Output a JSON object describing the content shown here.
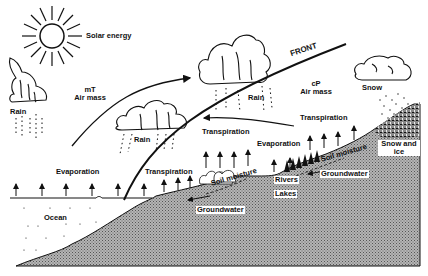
{
  "diagram": {
    "colors": {
      "ink": "#111111",
      "ground": "#9a9a9a",
      "background": "#ffffff"
    },
    "labels": {
      "solar_energy": "Solar energy",
      "front": "FRONT",
      "mT_line1": "mT",
      "mT_line2": "Air mass",
      "cP_line1": "cP",
      "cP_line2": "Air mass",
      "rain_left": "Rain",
      "rain_center": "Rain",
      "rain_upper": "Rain",
      "snow": "Snow",
      "transpiration_upper": "Transpiration",
      "transpiration_mid": "Transpiration",
      "transpiration_lower": "Transpiration",
      "evaporation_ocean": "Evaporation",
      "evaporation_land": "Evaporation",
      "ocean": "Ocean",
      "soil_moisture_left": "Soil moisture",
      "soil_moisture_right": "Soil moisture",
      "groundwater_left": "Groundwater",
      "groundwater_right": "Groundwater",
      "rivers": "Rivers",
      "lakes": "Lakes",
      "snow_and_ice_line1": "Snow and",
      "snow_and_ice_line2": "ice"
    },
    "icons": [
      "sun-icon",
      "cloud-icon",
      "rain-icon",
      "snow-icon",
      "arrow-up-icon",
      "tree-icon"
    ]
  }
}
